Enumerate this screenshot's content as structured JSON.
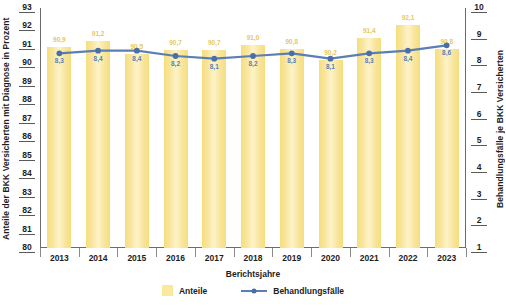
{
  "chart_data": {
    "type": "bar",
    "title": "",
    "xlabel": "Berichtsjahre",
    "ylabel": "Anteile der BKK Versicherten mit Diagnose in Prozent",
    "y2label": "Behandlungsfälle je BKK Versicherten",
    "categories": [
      "2013",
      "2014",
      "2015",
      "2016",
      "2017",
      "2018",
      "2019",
      "2020",
      "2021",
      "2022",
      "2023"
    ],
    "ylim": [
      80,
      93
    ],
    "y2lim": [
      1,
      10
    ],
    "yticks": [
      80,
      81,
      82,
      83,
      84,
      85,
      86,
      87,
      88,
      89,
      90,
      91,
      92,
      93
    ],
    "y2ticks": [
      1,
      2,
      3,
      4,
      5,
      6,
      7,
      8,
      9,
      10
    ],
    "grid": false,
    "legend_position": "bottom",
    "series": [
      {
        "name": "Anteile",
        "type": "bar",
        "axis": "left",
        "color": "#fae89c",
        "values": [
          90.9,
          91.2,
          90.5,
          90.7,
          90.7,
          91.0,
          90.8,
          90.2,
          91.4,
          92.1,
          90.8
        ],
        "labels": [
          "90,9",
          "91,2",
          "90,5",
          "90,7",
          "90,7",
          "91,0",
          "90,8",
          "90,2",
          "91,4",
          "92,1",
          "90,8"
        ]
      },
      {
        "name": "Behandlungsfälle",
        "type": "line",
        "axis": "right",
        "color": "#5b7fb4",
        "values": [
          8.3,
          8.4,
          8.4,
          8.2,
          8.1,
          8.2,
          8.3,
          8.1,
          8.3,
          8.4,
          8.6
        ],
        "labels": [
          "8,3",
          "8,4",
          "8,4",
          "8,2",
          "8,1",
          "8,2",
          "8,3",
          "8,1",
          "8,3",
          "8,4",
          "8,6"
        ]
      }
    ]
  },
  "legend": {
    "items": [
      {
        "label": "Anteile",
        "marker": "square-swatch"
      },
      {
        "label": "Behandlungsfälle",
        "marker": "line-marker"
      }
    ]
  }
}
